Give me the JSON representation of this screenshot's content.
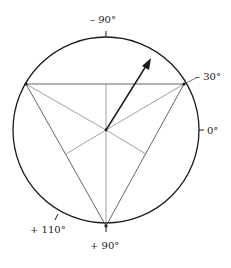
{
  "diagram": {
    "type": "polar-angle-diagram",
    "colors": {
      "ink": "#1a1a1a",
      "thin": "#555555"
    },
    "circle": {
      "cx": 106,
      "cy": 130,
      "r": 93
    },
    "triangle": {
      "vertices": [
        [
          26,
          84
        ],
        [
          184,
          84
        ],
        [
          106,
          226
        ]
      ]
    },
    "center": [
      106,
      130
    ],
    "arrow": {
      "from": [
        106,
        130
      ],
      "to": [
        150,
        60
      ]
    },
    "labels": {
      "minus90": "– 90°",
      "minus30": "– 30°",
      "zero": "0°",
      "plus110": "+ 110°",
      "plus90": "+ 90°"
    }
  }
}
